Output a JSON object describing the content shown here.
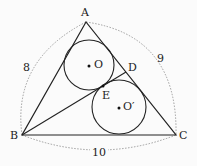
{
  "diagram": {
    "points": {
      "A": {
        "label": "A",
        "x": 86,
        "y": 22
      },
      "B": {
        "label": "B",
        "x": 22,
        "y": 135
      },
      "C": {
        "label": "C",
        "x": 176,
        "y": 135
      },
      "D": {
        "label": "D",
        "x": 126,
        "y": 72
      },
      "E": {
        "label": "E",
        "x": 103,
        "y": 86
      }
    },
    "circles": [
      {
        "label": "O",
        "cx": 89,
        "cy": 65,
        "r": 25
      },
      {
        "label": "O′",
        "cx": 119,
        "cy": 107,
        "r": 27
      }
    ],
    "side_lengths": {
      "AB": "8",
      "AC": "9",
      "BC": "10"
    },
    "colors": {
      "line": "#222222",
      "dashed": "#888888"
    }
  }
}
